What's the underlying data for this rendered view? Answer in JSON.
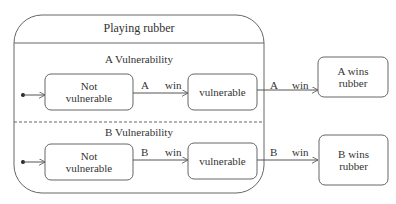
{
  "diagram": {
    "type": "uml-state-machine",
    "composite_state": {
      "title": "Playing rubber",
      "regions": [
        {
          "title": "A Vulnerability",
          "states": [
            {
              "line1": "Not",
              "line2": "vulnerable"
            },
            {
              "line1": "vulnerable"
            }
          ],
          "transition_labels": [
            {
              "player": "A",
              "event": "win"
            },
            {
              "player": "A",
              "event": "win"
            }
          ]
        },
        {
          "title": "B Vulnerability",
          "states": [
            {
              "line1": "Not",
              "line2": "vulnerable"
            },
            {
              "line1": "vulnerable"
            }
          ],
          "transition_labels": [
            {
              "player": "B",
              "event": "win"
            },
            {
              "player": "B",
              "event": "win"
            }
          ]
        }
      ]
    },
    "final_states": [
      {
        "line1": "A wins",
        "line2": "rubber"
      },
      {
        "line1": "B wins",
        "line2": "rubber"
      }
    ],
    "colors": {
      "line": "#555555",
      "text": "#333333",
      "background": "#ffffff"
    }
  }
}
